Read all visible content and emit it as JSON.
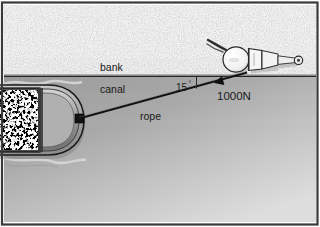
{
  "figure": {
    "width": 320,
    "height": 227,
    "border_color": "#3a3a3a",
    "background_color": "#ffffff"
  },
  "regions": {
    "bank": {
      "label": "bank",
      "description": "stippled gravel towpath above the waterline",
      "fill_color": "#f2f2f2",
      "speckle_color": "#9a9a9a",
      "top": 6,
      "bottom": 76
    },
    "canal": {
      "label": "canal",
      "description": "grey water surface below the bank edge",
      "fill_top_color": "#9b9b9b",
      "fill_bottom_color": "#d8d8d8",
      "top": 76,
      "bottom": 221
    },
    "waterline": {
      "label": "waterline",
      "color": "#2b2b2b",
      "y": 76
    }
  },
  "objects": {
    "barge": {
      "label": "barge",
      "description": "loaded canal barge seen from above, bow pointing right",
      "hull_color": "#b9b9b9",
      "hull_outline": "#1e1e1e",
      "deck_color": "#a8a8a8",
      "cargo": {
        "label": "cargo",
        "description": "high contrast black and white speckled load in the hold",
        "light_color": "#ffffff",
        "dark_color": "#151515"
      },
      "bollard": {
        "label": "bollard",
        "description": "black rope attachment block at the bow",
        "color": "#141414",
        "x": 79,
        "y": 118
      }
    },
    "tower": {
      "label": "person-towing",
      "description": "figure on the bank pulling the rope, viewed from above",
      "body_color": "#f7f7f7",
      "outline_color": "#2a2a2a",
      "head_x": 236,
      "head_y": 59
    }
  },
  "annotations": {
    "bank_label": "bank",
    "canal_label": "canal",
    "rope_label": "rope",
    "force_label": "1000N",
    "angle_value": "15",
    "angle_degree_symbol": "°",
    "angle_full": "15°"
  },
  "rope": {
    "label": "rope",
    "color": "#171717",
    "from_x": 79,
    "from_y": 118,
    "to_x": 246,
    "to_y": 73,
    "arrow": {
      "label": "force-arrow",
      "description": "solid triangular arrowhead pointing up the rope toward the bank",
      "x": 213,
      "y": 82,
      "color": "#111111"
    }
  },
  "angle_marker": {
    "label": "angle-marker",
    "description": "small tick showing the 15 degree angle between rope and waterline",
    "color": "#2b2b2b",
    "x": 196,
    "y": 78
  },
  "colors": {
    "ink": "#1a1a1a",
    "bank_fill": "#f2f2f2",
    "water_dark": "#9b9b9b",
    "water_light": "#d8d8d8",
    "rope": "#171717"
  }
}
